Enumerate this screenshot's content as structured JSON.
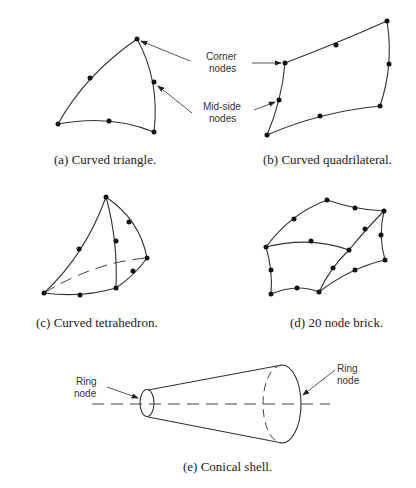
{
  "figures": {
    "a": {
      "caption": "(a)  Curved triangle."
    },
    "b": {
      "caption": "(b)  Curved quadrilateral.",
      "labels": {
        "corner_line1": "Corner",
        "corner_line2": "nodes",
        "midside_line1": "Mid-side",
        "midside_line2": "nodes"
      }
    },
    "c": {
      "caption": "(c)  Curved tetrahedron."
    },
    "d": {
      "caption": "(d)  20 node brick."
    },
    "e": {
      "caption": "(e)  Conical shell.",
      "labels": {
        "left_line1": "Ring",
        "left_line2": "node",
        "right_line1": "Ring",
        "right_line2": "node"
      }
    }
  },
  "colors": {
    "stroke": "#333333",
    "node": "#111111",
    "background": "#ffffff"
  }
}
